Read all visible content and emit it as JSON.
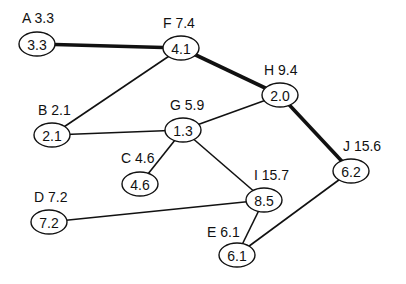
{
  "diagram": {
    "type": "network-graph",
    "nodes": [
      {
        "id": "A",
        "label": "A 3.3",
        "value": "3.3",
        "x": 37,
        "y": 44,
        "lx": 22,
        "ly": 23
      },
      {
        "id": "F",
        "label": "F 7.4",
        "value": "4.1",
        "x": 181,
        "y": 48,
        "lx": 163,
        "ly": 28
      },
      {
        "id": "H",
        "label": "H 9.4",
        "value": "2.0",
        "x": 280,
        "y": 95,
        "lx": 264,
        "ly": 75
      },
      {
        "id": "B",
        "label": "B 2.1",
        "value": "2.1",
        "x": 52,
        "y": 135,
        "lx": 38,
        "ly": 115
      },
      {
        "id": "G",
        "label": "G 5.9",
        "value": "1.3",
        "x": 183,
        "y": 130,
        "lx": 170,
        "ly": 110
      },
      {
        "id": "C",
        "label": "C 4.6",
        "value": "4.6",
        "x": 140,
        "y": 184,
        "lx": 121,
        "ly": 163
      },
      {
        "id": "J",
        "label": "J 15.6",
        "value": "6.2",
        "x": 351,
        "y": 171,
        "lx": 343,
        "ly": 151
      },
      {
        "id": "D",
        "label": "D 7.2",
        "value": "7.2",
        "x": 49,
        "y": 222,
        "lx": 34,
        "ly": 202
      },
      {
        "id": "I",
        "label": "I 15.7",
        "value": "8.5",
        "x": 264,
        "y": 200,
        "lx": 254,
        "ly": 180
      },
      {
        "id": "E",
        "label": "E 6.1",
        "value": "6.1",
        "x": 237,
        "y": 255,
        "lx": 207,
        "ly": 237
      }
    ],
    "edges": [
      {
        "from": "A",
        "to": "F",
        "critical": true
      },
      {
        "from": "F",
        "to": "H",
        "critical": true
      },
      {
        "from": "H",
        "to": "J",
        "critical": true
      },
      {
        "from": "F",
        "to": "B",
        "critical": false
      },
      {
        "from": "B",
        "to": "G",
        "critical": false
      },
      {
        "from": "G",
        "to": "H",
        "critical": false
      },
      {
        "from": "G",
        "to": "C",
        "critical": false
      },
      {
        "from": "G",
        "to": "I",
        "critical": false
      },
      {
        "from": "D",
        "to": "I",
        "critical": false
      },
      {
        "from": "I",
        "to": "E",
        "critical": false
      },
      {
        "from": "J",
        "to": "E",
        "critical": false
      }
    ],
    "node_rx": 18,
    "node_ry": 12,
    "colors": {
      "stroke": "#111111",
      "background": "#ffffff"
    }
  }
}
